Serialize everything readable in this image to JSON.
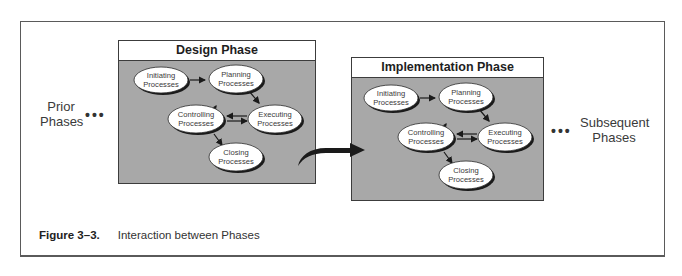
{
  "figure": {
    "number": "Figure 3–3.",
    "title": "Interaction between Phases"
  },
  "side_labels": {
    "prior": {
      "line1": "Prior",
      "line2": "Phases",
      "dots": "•••"
    },
    "subsequent": {
      "line1": "Subsequent",
      "line2": "Phases",
      "dots": "•••"
    }
  },
  "phases": [
    {
      "title": "Design Phase",
      "nodes": {
        "initiating": {
          "line1": "Initiating",
          "line2": "Processes"
        },
        "planning": {
          "line1": "Planning",
          "line2": "Processes"
        },
        "controlling": {
          "line1": "Controlling",
          "line2": "Processes"
        },
        "executing": {
          "line1": "Executing",
          "line2": "Processes"
        },
        "closing": {
          "line1": "Closing",
          "line2": "Processes"
        }
      }
    },
    {
      "title": "Implementation Phase",
      "nodes": {
        "initiating": {
          "line1": "Initiating",
          "line2": "Processes"
        },
        "planning": {
          "line1": "Planning",
          "line2": "Processes"
        },
        "controlling": {
          "line1": "Controlling",
          "line2": "Processes"
        },
        "executing": {
          "line1": "Executing",
          "line2": "Processes"
        },
        "closing": {
          "line1": "Closing",
          "line2": "Processes"
        }
      }
    }
  ],
  "edges": [
    {
      "from": "initiating",
      "to": "planning"
    },
    {
      "from": "planning",
      "to": "executing"
    },
    {
      "from": "executing",
      "to": "controlling"
    },
    {
      "from": "controlling",
      "to": "executing"
    },
    {
      "from": "controlling",
      "to": "planning"
    },
    {
      "from": "controlling",
      "to": "closing"
    }
  ],
  "colors": {
    "phase_fill": "#a8a8a8",
    "node_fill": "#ffffff",
    "node_shadow": "#1a1a1a",
    "border": "#3c3c3c",
    "arrow": "#1a1a1a"
  }
}
